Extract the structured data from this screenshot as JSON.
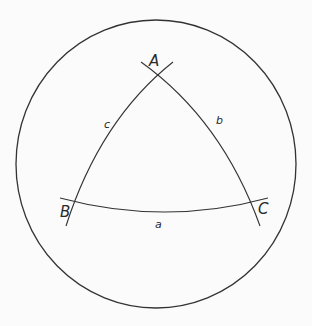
{
  "diagram": {
    "type": "spherical-triangle",
    "sphere": {
      "cx": 156,
      "cy": 164,
      "rx": 140,
      "ry": 144
    },
    "colors": {
      "stroke": "#333333",
      "background": "#fbfbfb"
    },
    "vertices": [
      {
        "id": "A",
        "label": "A",
        "x": 157,
        "y": 72
      },
      {
        "id": "B",
        "label": "B",
        "x": 72,
        "y": 203
      },
      {
        "id": "C",
        "label": "C",
        "x": 257,
        "y": 202
      }
    ],
    "sides": [
      {
        "id": "a",
        "label": "a",
        "between": [
          "B",
          "C"
        ]
      },
      {
        "id": "b",
        "label": "b",
        "between": [
          "A",
          "C"
        ]
      },
      {
        "id": "c",
        "label": "c",
        "between": [
          "A",
          "B"
        ]
      }
    ]
  }
}
